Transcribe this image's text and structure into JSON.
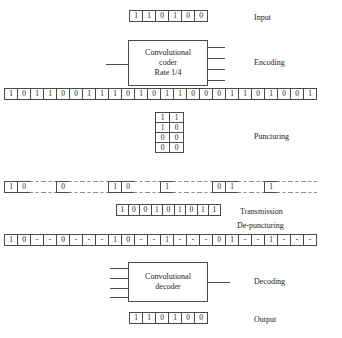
{
  "diagram": {
    "stages": {
      "input": {
        "label": "Input",
        "bits": [
          "1",
          "1",
          "0",
          "1",
          "0",
          "0"
        ]
      },
      "encoding": {
        "label": "Encoding",
        "block_line1": "Convolutional",
        "block_line2": "coder",
        "block_line3": "Rate 1/4",
        "input_lines": 1,
        "output_lines": 4,
        "encoded_bits": [
          "1",
          "0",
          "1",
          "1",
          "0",
          "0",
          "1",
          "1",
          "1",
          "0",
          "1",
          "0",
          "1",
          "1",
          "0",
          "0",
          "0",
          "1",
          "1",
          "0",
          "1",
          "0",
          "0",
          "1"
        ]
      },
      "puncturing": {
        "label": "Puncturing",
        "matrix": [
          [
            "1",
            "1"
          ],
          [
            "1",
            "0"
          ],
          [
            "0",
            "0"
          ],
          [
            "0",
            "0"
          ]
        ],
        "punctured_bits": [
          "1",
          "0",
          "-",
          "-",
          "0",
          "-",
          "-",
          "-",
          "1",
          "0",
          "-",
          "-",
          "1",
          "-",
          "-",
          "-",
          "0",
          "1",
          "-",
          "-",
          "1",
          "-",
          "-",
          "-"
        ]
      },
      "transmission": {
        "label": "Transmission",
        "bits": [
          "1",
          "0",
          "0",
          "1",
          "0",
          "1",
          "0",
          "1",
          "1"
        ]
      },
      "depuncturing": {
        "label": "De-puncturing",
        "bits": [
          "1",
          "0",
          "-",
          "-",
          "0",
          "-",
          "-",
          "-",
          "1",
          "0",
          "-",
          "-",
          "1",
          "-",
          "-",
          "-",
          "0",
          "1",
          "-",
          "-",
          "1",
          "-",
          "-",
          "-"
        ]
      },
      "decoding": {
        "label": "Decoding",
        "block_line1": "Convolutional",
        "block_line2": "decoder",
        "input_lines": 4,
        "output_lines": 1
      },
      "output": {
        "label": "Output",
        "bits": [
          "1",
          "1",
          "0",
          "1",
          "0",
          "0"
        ]
      }
    },
    "colors": {
      "stroke": "#4a4a4a",
      "dashed_stroke": "#8c8c8c",
      "text": "#1a1a1a",
      "background": "#ffffff"
    }
  }
}
